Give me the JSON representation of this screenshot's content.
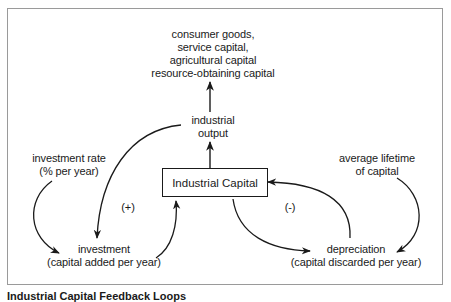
{
  "diagram": {
    "type": "feedback-loop",
    "nodes": {
      "outputs": {
        "lines": [
          "consumer goods,",
          "service capital,",
          "agricultural capital",
          "resource-obtaining capital"
        ]
      },
      "industrial_output": {
        "lines": [
          "industrial",
          "output"
        ]
      },
      "industrial_capital": {
        "label": "Industrial Capital"
      },
      "investment_rate": {
        "lines": [
          "investment rate",
          "(% per year)"
        ]
      },
      "investment": {
        "lines": [
          "investment",
          "(capital added per year)"
        ]
      },
      "average_lifetime": {
        "lines": [
          "average lifetime",
          "of capital"
        ]
      },
      "depreciation": {
        "lines": [
          "depreciation",
          "(capital discarded per year)"
        ]
      }
    },
    "loop_signs": {
      "positive": "(+)",
      "negative": "(-)"
    },
    "edges": [
      {
        "from": "industrial_output",
        "to": "outputs"
      },
      {
        "from": "industrial_capital",
        "to": "industrial_output"
      },
      {
        "from": "industrial_output",
        "to": "investment"
      },
      {
        "from": "investment_rate",
        "to": "investment"
      },
      {
        "from": "investment",
        "to": "industrial_capital"
      },
      {
        "from": "industrial_capital",
        "to": "depreciation"
      },
      {
        "from": "depreciation",
        "to": "industrial_capital"
      },
      {
        "from": "average_lifetime",
        "to": "depreciation"
      }
    ],
    "colors": {
      "line": "#1a1a1a",
      "frame": "#9a9a9a"
    }
  },
  "caption": "Industrial Capital Feedback Loops"
}
